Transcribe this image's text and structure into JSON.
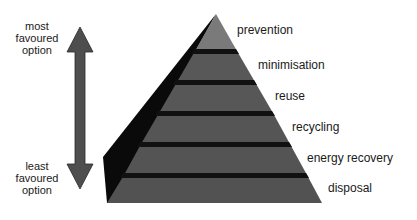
{
  "diagram": {
    "type": "pyramid",
    "levels": [
      {
        "label": "prevention"
      },
      {
        "label": "minimisation"
      },
      {
        "label": "reuse"
      },
      {
        "label": "recycling"
      },
      {
        "label": "energy recovery"
      },
      {
        "label": "disposal"
      }
    ],
    "arrow": {
      "top_label": [
        "most",
        "favoured",
        "option"
      ],
      "bottom_label": [
        "least",
        "favoured",
        "option"
      ]
    },
    "colors": {
      "top_band": "#7a7a7a",
      "band": "#555555",
      "separator": "#111111",
      "side_face": "#0a0a0a",
      "arrow": "#4e4e4e"
    }
  }
}
